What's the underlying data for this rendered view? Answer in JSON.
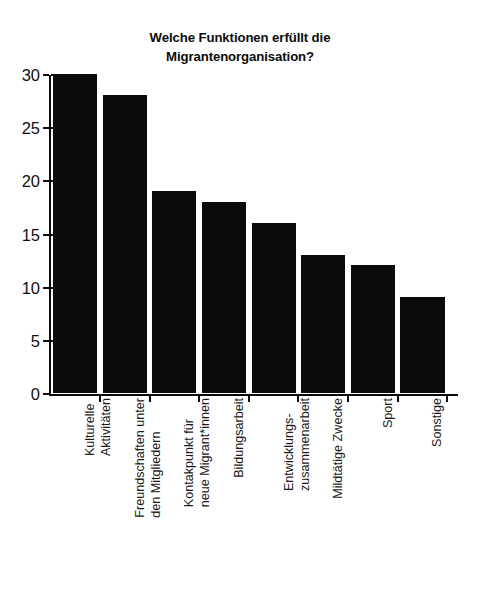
{
  "chart_data": {
    "type": "bar",
    "title": "Welche Funktionen erfüllt die\nMigrantenorganisation?",
    "xlabel": "",
    "ylabel": "",
    "ylim": [
      0,
      30
    ],
    "yticks": [
      0,
      5,
      10,
      15,
      20,
      25,
      30
    ],
    "ytick_labels": [
      "0",
      "5",
      "10",
      "15",
      "20",
      "25",
      "30"
    ],
    "grid": false,
    "legend": null,
    "bar_color": "#0b0b0b",
    "categories": [
      "Kulturelle\nAktivitäten",
      "Freundschaften unter\nden Mitgliedern",
      "Kontakpunkt für\nneue Migrant*innen",
      "Bildungsarbeit",
      "Entwicklungs-\nzusammenarbeit",
      "Mildtätige Zwecke",
      "Sport",
      "Sonstige"
    ],
    "values": [
      30,
      28,
      19,
      18,
      16,
      13,
      12,
      9
    ]
  }
}
